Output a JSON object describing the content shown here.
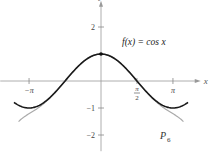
{
  "chart_data": {
    "type": "line",
    "title": "",
    "xlabel": "x",
    "ylabel": "y",
    "xlim": [
      -4.4,
      4.4
    ],
    "ylim": [
      -2.6,
      2.9
    ],
    "x_ticks": [
      {
        "value": -3.14159,
        "label": "−π"
      },
      {
        "value": 1.5708,
        "label_num": "π",
        "label_den": "2"
      },
      {
        "value": 3.14159,
        "label": "π"
      }
    ],
    "y_ticks": [
      {
        "value": 2,
        "label": "2"
      },
      {
        "value": -1,
        "label": "−1"
      },
      {
        "value": -2,
        "label": "−2"
      }
    ],
    "series": [
      {
        "name": "f(x) = cos x",
        "function": "cos",
        "domain": [
          -3.8,
          3.8
        ],
        "color": "#1a1a1a"
      },
      {
        "name": "P6",
        "function": "taylor6_cos",
        "domain": [
          -3.6,
          3.6
        ],
        "color": "#aaaaaa"
      }
    ],
    "points": [
      {
        "x": 0,
        "y": 1
      }
    ],
    "annotations": {
      "f_label": "f(x) = cos x",
      "p_label": "P",
      "p_sub": "6"
    }
  }
}
